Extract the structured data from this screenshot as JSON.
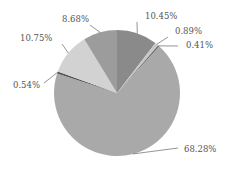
{
  "chart_data": {
    "type": "pie",
    "title": "",
    "start_angle_deg": 0,
    "direction": "clockwise",
    "slices": [
      {
        "label": "10.45%",
        "value": 10.45,
        "color": "#8a8a8a"
      },
      {
        "label": "0.89%",
        "value": 0.89,
        "color": "#c8c8c8"
      },
      {
        "label": "0.41%",
        "value": 0.41,
        "color": "#707070"
      },
      {
        "label": "68.28%",
        "value": 68.28,
        "color": "#a9a9a9"
      },
      {
        "label": "0.54%",
        "value": 0.54,
        "color": "#555555"
      },
      {
        "label": "10.75%",
        "value": 10.75,
        "color": "#d2d2d2"
      },
      {
        "label": "8.68%",
        "value": 8.68,
        "color": "#9c9c9c"
      }
    ],
    "legend": "none",
    "labels_outside": true
  }
}
